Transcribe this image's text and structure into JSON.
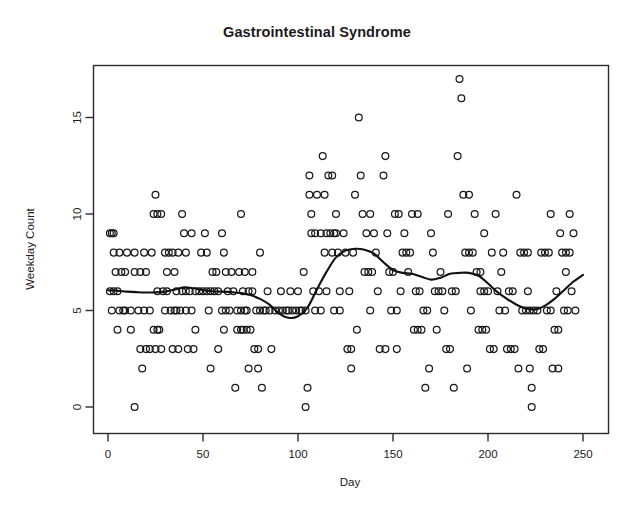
{
  "chart_data": {
    "type": "scatter",
    "title": "Gastrointestinal Syndrome",
    "xlabel": "Day",
    "ylabel": "Weekday Count",
    "xlim": [
      -5,
      258
    ],
    "ylim": [
      -0.9,
      17.8
    ],
    "xticks": [
      0,
      50,
      100,
      150,
      200,
      250
    ],
    "yticks": [
      0,
      5,
      10,
      15
    ],
    "grid": false,
    "legend": null,
    "marker": "open-circle",
    "marker_color": "#1a1a1a",
    "line_color": "#111111",
    "box_color": "#2b2b2b",
    "points": [
      [
        1,
        9
      ],
      [
        2,
        9
      ],
      [
        3,
        9
      ],
      [
        1,
        6
      ],
      [
        3,
        6
      ],
      [
        5,
        6
      ],
      [
        2,
        5
      ],
      [
        6,
        5
      ],
      [
        8,
        5
      ],
      [
        9,
        5
      ],
      [
        12,
        5
      ],
      [
        3,
        8
      ],
      [
        6,
        8
      ],
      [
        10,
        8
      ],
      [
        4,
        7
      ],
      [
        7,
        7
      ],
      [
        9,
        7
      ],
      [
        5,
        4
      ],
      [
        12,
        4
      ],
      [
        14,
        0
      ],
      [
        18,
        2
      ],
      [
        14,
        7
      ],
      [
        17,
        7
      ],
      [
        20,
        7
      ],
      [
        14,
        8
      ],
      [
        19,
        8
      ],
      [
        23,
        8
      ],
      [
        16,
        5
      ],
      [
        19,
        5
      ],
      [
        22,
        5
      ],
      [
        17,
        3
      ],
      [
        20,
        3
      ],
      [
        22,
        3
      ],
      [
        25,
        3
      ],
      [
        28,
        3
      ],
      [
        25,
        11
      ],
      [
        24,
        10
      ],
      [
        26,
        10
      ],
      [
        28,
        10
      ],
      [
        24,
        4
      ],
      [
        26,
        4
      ],
      [
        27,
        4
      ],
      [
        26,
        6
      ],
      [
        29,
        6
      ],
      [
        31,
        6
      ],
      [
        30,
        8
      ],
      [
        32,
        8
      ],
      [
        34,
        8
      ],
      [
        37,
        8
      ],
      [
        30,
        5
      ],
      [
        33,
        5
      ],
      [
        35,
        5
      ],
      [
        36,
        5
      ],
      [
        38,
        5
      ],
      [
        31,
        7
      ],
      [
        35,
        7
      ],
      [
        34,
        3
      ],
      [
        37,
        3
      ],
      [
        36,
        6
      ],
      [
        39,
        6
      ],
      [
        41,
        6
      ],
      [
        39,
        10
      ],
      [
        40,
        9
      ],
      [
        44,
        9
      ],
      [
        41,
        8
      ],
      [
        41,
        5
      ],
      [
        44,
        5
      ],
      [
        42,
        3
      ],
      [
        45,
        3
      ],
      [
        43,
        6
      ],
      [
        46,
        6
      ],
      [
        48,
        6
      ],
      [
        46,
        4
      ],
      [
        49,
        8
      ],
      [
        52,
        8
      ],
      [
        50,
        6
      ],
      [
        52,
        6
      ],
      [
        54,
        6
      ],
      [
        51,
        9
      ],
      [
        53,
        5
      ],
      [
        54,
        2
      ],
      [
        55,
        7
      ],
      [
        57,
        7
      ],
      [
        56,
        6
      ],
      [
        58,
        6
      ],
      [
        58,
        3
      ],
      [
        60,
        9
      ],
      [
        60,
        5
      ],
      [
        62,
        5
      ],
      [
        64,
        5
      ],
      [
        61,
        8
      ],
      [
        61,
        4
      ],
      [
        62,
        7
      ],
      [
        65,
        7
      ],
      [
        63,
        6
      ],
      [
        66,
        6
      ],
      [
        67,
        1
      ],
      [
        68,
        5
      ],
      [
        70,
        5
      ],
      [
        72,
        5
      ],
      [
        73,
        5
      ],
      [
        68,
        4
      ],
      [
        70,
        4
      ],
      [
        71,
        4
      ],
      [
        69,
        7
      ],
      [
        72,
        7
      ],
      [
        70,
        10
      ],
      [
        71,
        6
      ],
      [
        74,
        6
      ],
      [
        76,
        6
      ],
      [
        73,
        4
      ],
      [
        75,
        4
      ],
      [
        74,
        2
      ],
      [
        76,
        7
      ],
      [
        77,
        3
      ],
      [
        79,
        3
      ],
      [
        78,
        5
      ],
      [
        80,
        5
      ],
      [
        82,
        5
      ],
      [
        79,
        2
      ],
      [
        80,
        8
      ],
      [
        81,
        1
      ],
      [
        83,
        5
      ],
      [
        85,
        5
      ],
      [
        84,
        6
      ],
      [
        86,
        3
      ],
      [
        88,
        5
      ],
      [
        90,
        5
      ],
      [
        91,
        6
      ],
      [
        92,
        5
      ],
      [
        94,
        5
      ],
      [
        95,
        5
      ],
      [
        97,
        5
      ],
      [
        96,
        6
      ],
      [
        99,
        5
      ],
      [
        101,
        5
      ],
      [
        100,
        6
      ],
      [
        102,
        5
      ],
      [
        104,
        5
      ],
      [
        103,
        7
      ],
      [
        104,
        0
      ],
      [
        105,
        1
      ],
      [
        106,
        12
      ],
      [
        106,
        11
      ],
      [
        110,
        11
      ],
      [
        107,
        9
      ],
      [
        109,
        9
      ],
      [
        107,
        10
      ],
      [
        108,
        6
      ],
      [
        111,
        6
      ],
      [
        109,
        5
      ],
      [
        112,
        5
      ],
      [
        112,
        9
      ],
      [
        115,
        9
      ],
      [
        113,
        13
      ],
      [
        114,
        8
      ],
      [
        114,
        11
      ],
      [
        115,
        6
      ],
      [
        116,
        12
      ],
      [
        118,
        12
      ],
      [
        117,
        9
      ],
      [
        119,
        9
      ],
      [
        120,
        9
      ],
      [
        118,
        8
      ],
      [
        121,
        8
      ],
      [
        119,
        5
      ],
      [
        122,
        5
      ],
      [
        120,
        10
      ],
      [
        122,
        6
      ],
      [
        124,
        9
      ],
      [
        125,
        8
      ],
      [
        126,
        3
      ],
      [
        128,
        3
      ],
      [
        127,
        6
      ],
      [
        128,
        2
      ],
      [
        129,
        8
      ],
      [
        130,
        11
      ],
      [
        131,
        4
      ],
      [
        132,
        15
      ],
      [
        133,
        12
      ],
      [
        134,
        10
      ],
      [
        138,
        10
      ],
      [
        135,
        7
      ],
      [
        137,
        7
      ],
      [
        139,
        7
      ],
      [
        136,
        9
      ],
      [
        140,
        9
      ],
      [
        138,
        5
      ],
      [
        141,
        8
      ],
      [
        142,
        6
      ],
      [
        143,
        3
      ],
      [
        146,
        3
      ],
      [
        145,
        12
      ],
      [
        146,
        13
      ],
      [
        147,
        9
      ],
      [
        148,
        7
      ],
      [
        150,
        7
      ],
      [
        149,
        5
      ],
      [
        152,
        5
      ],
      [
        151,
        10
      ],
      [
        153,
        10
      ],
      [
        152,
        3
      ],
      [
        154,
        6
      ],
      [
        155,
        8
      ],
      [
        157,
        8
      ],
      [
        159,
        8
      ],
      [
        156,
        9
      ],
      [
        158,
        7
      ],
      [
        160,
        10
      ],
      [
        163,
        10
      ],
      [
        161,
        4
      ],
      [
        163,
        4
      ],
      [
        165,
        4
      ],
      [
        162,
        6
      ],
      [
        164,
        6
      ],
      [
        166,
        5
      ],
      [
        168,
        5
      ],
      [
        167,
        1
      ],
      [
        169,
        2
      ],
      [
        170,
        9
      ],
      [
        171,
        8
      ],
      [
        172,
        6
      ],
      [
        174,
        6
      ],
      [
        173,
        4
      ],
      [
        175,
        7
      ],
      [
        176,
        6
      ],
      [
        177,
        5
      ],
      [
        178,
        3
      ],
      [
        180,
        3
      ],
      [
        179,
        10
      ],
      [
        181,
        6
      ],
      [
        183,
        6
      ],
      [
        182,
        1
      ],
      [
        184,
        13
      ],
      [
        185,
        17
      ],
      [
        186,
        16
      ],
      [
        187,
        11
      ],
      [
        190,
        11
      ],
      [
        188,
        8
      ],
      [
        190,
        8
      ],
      [
        192,
        8
      ],
      [
        189,
        2
      ],
      [
        191,
        5
      ],
      [
        193,
        10
      ],
      [
        194,
        7
      ],
      [
        196,
        7
      ],
      [
        195,
        4
      ],
      [
        197,
        4
      ],
      [
        199,
        4
      ],
      [
        196,
        6
      ],
      [
        198,
        6
      ],
      [
        200,
        6
      ],
      [
        198,
        9
      ],
      [
        201,
        3
      ],
      [
        203,
        3
      ],
      [
        202,
        8
      ],
      [
        204,
        10
      ],
      [
        205,
        6
      ],
      [
        206,
        5
      ],
      [
        207,
        7
      ],
      [
        208,
        8
      ],
      [
        209,
        5
      ],
      [
        210,
        3
      ],
      [
        212,
        3
      ],
      [
        214,
        3
      ],
      [
        211,
        6
      ],
      [
        213,
        6
      ],
      [
        215,
        11
      ],
      [
        216,
        2
      ],
      [
        217,
        8
      ],
      [
        219,
        8
      ],
      [
        221,
        8
      ],
      [
        218,
        5
      ],
      [
        220,
        5
      ],
      [
        222,
        5
      ],
      [
        221,
        6
      ],
      [
        222,
        2
      ],
      [
        223,
        0
      ],
      [
        223,
        1
      ],
      [
        224,
        5
      ],
      [
        226,
        5
      ],
      [
        227,
        3
      ],
      [
        229,
        3
      ],
      [
        228,
        8
      ],
      [
        230,
        8
      ],
      [
        232,
        8
      ],
      [
        231,
        5
      ],
      [
        233,
        5
      ],
      [
        233,
        10
      ],
      [
        234,
        2
      ],
      [
        237,
        2
      ],
      [
        235,
        4
      ],
      [
        237,
        4
      ],
      [
        236,
        6
      ],
      [
        238,
        9
      ],
      [
        239,
        8
      ],
      [
        241,
        8
      ],
      [
        243,
        8
      ],
      [
        240,
        5
      ],
      [
        242,
        5
      ],
      [
        241,
        7
      ],
      [
        243,
        10
      ],
      [
        244,
        6
      ],
      [
        245,
        9
      ],
      [
        246,
        5
      ]
    ],
    "smooth_line": [
      [
        0,
        6.05
      ],
      [
        5,
        6.02
      ],
      [
        10,
        5.98
      ],
      [
        15,
        5.95
      ],
      [
        20,
        5.93
      ],
      [
        25,
        5.94
      ],
      [
        30,
        5.98
      ],
      [
        35,
        6.08
      ],
      [
        40,
        6.2
      ],
      [
        45,
        6.15
      ],
      [
        50,
        6.05
      ],
      [
        55,
        6.0
      ],
      [
        60,
        5.98
      ],
      [
        65,
        5.95
      ],
      [
        70,
        5.9
      ],
      [
        75,
        5.8
      ],
      [
        80,
        5.6
      ],
      [
        85,
        5.3
      ],
      [
        90,
        4.85
      ],
      [
        95,
        4.62
      ],
      [
        100,
        4.7
      ],
      [
        105,
        5.15
      ],
      [
        110,
        6.1
      ],
      [
        115,
        7.0
      ],
      [
        120,
        7.75
      ],
      [
        125,
        8.1
      ],
      [
        130,
        8.2
      ],
      [
        135,
        8.15
      ],
      [
        140,
        7.95
      ],
      [
        145,
        7.5
      ],
      [
        150,
        7.1
      ],
      [
        155,
        6.95
      ],
      [
        160,
        6.9
      ],
      [
        165,
        6.75
      ],
      [
        170,
        6.6
      ],
      [
        175,
        6.7
      ],
      [
        180,
        6.9
      ],
      [
        185,
        6.95
      ],
      [
        190,
        6.95
      ],
      [
        195,
        6.8
      ],
      [
        200,
        6.4
      ],
      [
        205,
        5.95
      ],
      [
        210,
        5.6
      ],
      [
        215,
        5.3
      ],
      [
        220,
        5.1
      ],
      [
        225,
        5.05
      ],
      [
        230,
        5.25
      ],
      [
        235,
        5.6
      ],
      [
        240,
        6.05
      ],
      [
        245,
        6.5
      ],
      [
        250,
        6.85
      ]
    ]
  }
}
